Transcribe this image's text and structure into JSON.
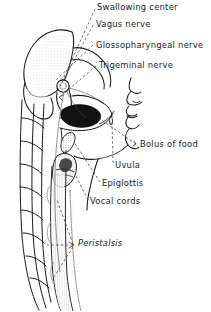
{
  "figure": {
    "style": "pen-and-ink line drawing, black on white",
    "colors": {
      "ink": "#1a1a1a",
      "bolus_fill": "#111111",
      "paper": "#ffffff",
      "shading": "#9a9a9a",
      "leader_line": "#333333"
    }
  },
  "labels": [
    {
      "id": "swallowing-center",
      "text": "Swallowing center",
      "x": 97,
      "y": 5,
      "italic": false
    },
    {
      "id": "vagus-nerve",
      "text": "Vagus nerve",
      "x": 96,
      "y": 22,
      "italic": false
    },
    {
      "id": "glossopharyngeal-nerve",
      "text": "Glossopharyngeal nerve",
      "x": 96,
      "y": 43,
      "italic": false
    },
    {
      "id": "trigeminal-nerve",
      "text": "Trigeminal nerve",
      "x": 99,
      "y": 64,
      "italic": false
    },
    {
      "id": "bolus-of-food",
      "text": "Bolus of food",
      "x": 140,
      "y": 143,
      "italic": false
    },
    {
      "id": "uvula",
      "text": "Uvula",
      "x": 115,
      "y": 164,
      "italic": false
    },
    {
      "id": "epiglottis",
      "text": "Epiglottis",
      "x": 102,
      "y": 182,
      "italic": false
    },
    {
      "id": "vocal-cords",
      "text": "Vocal cords",
      "x": 90,
      "y": 200,
      "italic": false
    },
    {
      "id": "peristalsis",
      "text": "Peristalsis",
      "x": 76,
      "y": 242,
      "italic": true
    }
  ],
  "anatomy_parts": [
    "cerebrum",
    "brainstem",
    "cerebellum",
    "swallowing-center",
    "skull-base",
    "face-profile",
    "nose",
    "lips",
    "chin",
    "tongue",
    "soft-palate",
    "uvula",
    "pharynx",
    "epiglottis",
    "larynx",
    "vocal-cords",
    "trachea",
    "esophagus",
    "cervical-vertebrae",
    "bolus-of-food"
  ],
  "leader_lines": {
    "style": "dashed",
    "count": 12
  }
}
